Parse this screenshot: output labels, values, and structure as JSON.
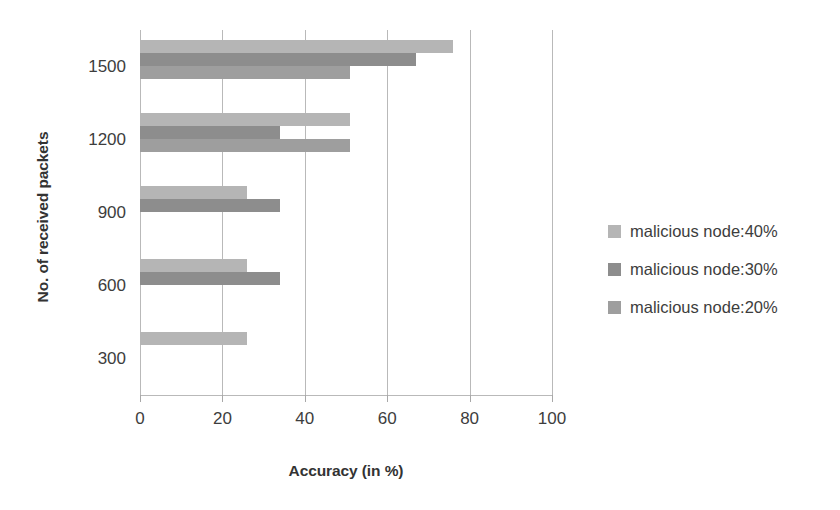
{
  "chart_data": {
    "type": "bar",
    "orientation": "horizontal",
    "title": "",
    "xlabel": "Accuracy (in %)",
    "ylabel": "No. of received packets",
    "categories": [
      "300",
      "600",
      "900",
      "1200",
      "1500"
    ],
    "xlim": [
      0,
      100
    ],
    "xticks": [
      0,
      20,
      40,
      60,
      80,
      100
    ],
    "xtick_labels": [
      "0",
      "20",
      "40",
      "60",
      "80",
      "100"
    ],
    "grid": "vertical",
    "legend_position": "right",
    "series": [
      {
        "name": "malicious node:40%",
        "color": "#b5b5b5",
        "values": [
          26,
          26,
          26,
          51,
          76
        ]
      },
      {
        "name": "malicious node:30%",
        "color": "#8d8d8d",
        "values": [
          0,
          34,
          34,
          34,
          67
        ]
      },
      {
        "name": "malicious node:20%",
        "color": "#9e9e9e",
        "values": [
          0,
          0,
          0,
          51,
          51
        ]
      }
    ]
  },
  "legend": {
    "items": [
      {
        "label": "malicious node:40%",
        "color": "#b5b5b5"
      },
      {
        "label": "malicious node:30%",
        "color": "#8d8d8d"
      },
      {
        "label": "malicious node:20%",
        "color": "#9e9e9e"
      }
    ]
  }
}
